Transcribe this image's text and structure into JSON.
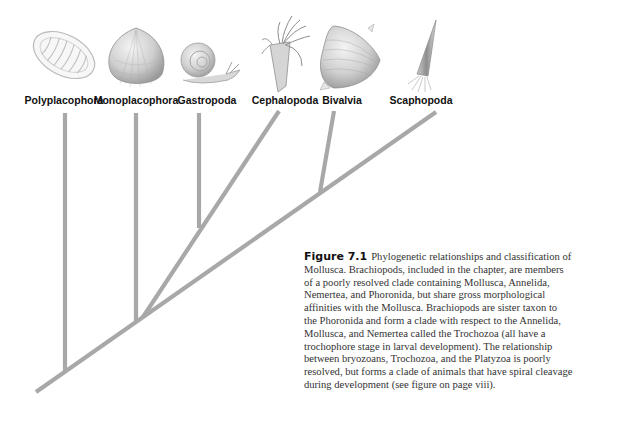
{
  "figure": {
    "branch_color": "#a8a8a8",
    "taxa": [
      {
        "name": "Polyplacophora",
        "icon": "chiton-shell-icon"
      },
      {
        "name": "Monoplacophora",
        "icon": "limpet-shell-icon"
      },
      {
        "name": "Gastropoda",
        "icon": "snail-icon"
      },
      {
        "name": "Cephalopoda",
        "icon": "squid-icon"
      },
      {
        "name": "Bivalvia",
        "icon": "clam-shell-icon"
      },
      {
        "name": "Scaphopoda",
        "icon": "tusk-shell-icon"
      }
    ],
    "tree_topology": "(Polyplacophora,(Monoplacophora,((Gastropoda,Cephalopoda),(Bivalvia,Scaphopoda))))"
  },
  "caption": {
    "figure_number": "Figure 7.1",
    "lines": [
      "Phylogenetic relationships and classification of",
      "Mollusca.  Brachiopods, included in the chapter, are members",
      "of a poorly resolved clade containing Mollusca, Annelida,",
      "Nemertea, and Phoronida, but share gross morphological",
      "affinities with the Mollusca. Brachiopods are sister taxon to",
      "the Phoronida and form a clade with respect to the Annelida,",
      "Mollusca, and Nemertea called the Trochozoa (all have a",
      "trochophore stage in larval development).  The relationship",
      "between bryozoans, Trochozoa, and the Platyzoa is poorly",
      "resolved, but forms a clade of animals that have spiral cleavage",
      "during development (see figure on page viii)."
    ]
  }
}
